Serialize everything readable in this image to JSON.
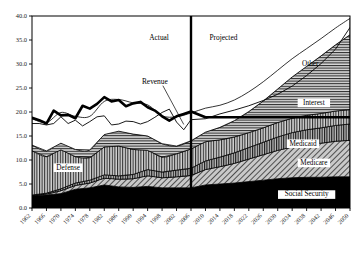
{
  "chart_data": {
    "type": "area",
    "title": "",
    "subtitle": "",
    "xlabel": "",
    "ylabel": "",
    "xlim": [
      1962,
      2050
    ],
    "ylim": [
      0,
      40
    ],
    "ytick_step": 5,
    "xtick_step": 4,
    "grid": false,
    "legend_position": "inline-annotations",
    "stacked": true,
    "ytick_labels": [
      "0.0",
      "5.0",
      "10.0",
      "15.0",
      "20.0",
      "25.0",
      "30.0",
      "35.0",
      "40.0"
    ],
    "ytick_values": [
      0,
      5,
      10,
      15,
      20,
      25,
      30,
      35,
      40
    ],
    "xtick_labels": [
      "1962",
      "1966",
      "1970",
      "1974",
      "1978",
      "1982",
      "1986",
      "1990",
      "1994",
      "1998",
      "2002",
      "2006",
      "2010",
      "2014",
      "2018",
      "2022",
      "2026",
      "2030",
      "2034",
      "2038",
      "2042",
      "2046",
      "2050"
    ],
    "xtick_values": [
      1962,
      1966,
      1970,
      1974,
      1978,
      1982,
      1986,
      1990,
      1994,
      1998,
      2002,
      2006,
      2010,
      2014,
      2018,
      2022,
      2026,
      2030,
      2034,
      2038,
      2042,
      2046,
      2050
    ],
    "annotations": [
      {
        "name": "actual-label",
        "text": "Actual",
        "x": 2001,
        "y": 35.0
      },
      {
        "name": "projected-label",
        "text": "Projected",
        "x": 2010,
        "y": 35.0
      },
      {
        "name": "divider-year",
        "text": "2006",
        "x": 2006,
        "y": 40
      }
    ],
    "x": [
      1962,
      1966,
      1970,
      1974,
      1978,
      1982,
      1986,
      1990,
      1994,
      1998,
      2002,
      2006,
      2010,
      2014,
      2018,
      2022,
      2026,
      2030,
      2034,
      2038,
      2042,
      2046,
      2050
    ],
    "series": [
      {
        "name": "Social Security",
        "label": "Social Security",
        "fill": "solid-black",
        "color": "#000000",
        "label_x": 2038,
        "label_y": 2.4,
        "values": [
          2.6,
          2.7,
          3.0,
          3.9,
          4.2,
          4.8,
          4.4,
          4.3,
          4.5,
          4.2,
          4.2,
          4.2,
          4.8,
          5.0,
          5.2,
          5.5,
          5.8,
          6.1,
          6.3,
          6.4,
          6.4,
          6.5,
          6.5
        ]
      },
      {
        "name": "Medicare",
        "label": "Medicare",
        "fill": "diagonal-hatch",
        "color": "#9a9a9a",
        "label_x": 2040,
        "label_y": 9.0,
        "values": [
          0.0,
          0.2,
          0.6,
          0.8,
          1.0,
          1.4,
          1.6,
          1.8,
          2.2,
          2.1,
          2.3,
          2.6,
          3.2,
          3.6,
          4.1,
          4.7,
          5.3,
          5.9,
          6.4,
          6.8,
          7.1,
          7.4,
          7.6
        ]
      },
      {
        "name": "Medicaid",
        "label": "Medicaid",
        "fill": "vertical-lines",
        "color": "#8c8c8c",
        "label_x": 2037,
        "label_y": 13.0,
        "values": [
          0.1,
          0.2,
          0.4,
          0.5,
          0.6,
          0.7,
          0.7,
          0.9,
          1.3,
          1.2,
          1.4,
          1.5,
          1.8,
          2.0,
          2.2,
          2.4,
          2.6,
          2.8,
          3.0,
          3.1,
          3.2,
          3.3,
          3.4
        ]
      },
      {
        "name": "Defense",
        "label": "Defense",
        "fill": "vertical-lines",
        "color": "#a6a6a6",
        "label_x": 1972,
        "label_y": 8.0,
        "values": [
          9.2,
          7.6,
          8.1,
          5.5,
          4.7,
          5.8,
          6.2,
          5.2,
          4.0,
          3.1,
          3.4,
          4.0,
          4.0,
          3.6,
          3.3,
          3.1,
          3.0,
          3.0,
          3.0,
          3.0,
          3.0,
          3.0,
          3.0
        ]
      },
      {
        "name": "Interest",
        "label": "Interest",
        "fill": "horizontal-lines",
        "color": "#7a7a7a",
        "label_x": 2040,
        "label_y": 21.5,
        "values": [
          1.2,
          1.2,
          1.4,
          1.5,
          1.6,
          2.6,
          3.1,
          3.2,
          3.0,
          2.8,
          1.6,
          1.7,
          2.0,
          2.6,
          3.4,
          4.4,
          5.6,
          7.0,
          8.6,
          10.2,
          12.0,
          13.8,
          15.6
        ]
      },
      {
        "name": "Other",
        "label": "Other",
        "fill": "white",
        "color": "#ffffff",
        "label_x": 2039,
        "label_y": 29.5,
        "values": [
          5.5,
          5.9,
          6.4,
          6.9,
          7.0,
          6.9,
          6.6,
          6.5,
          6.5,
          5.8,
          6.1,
          5.8,
          5.0,
          4.6,
          4.3,
          4.1,
          4.0,
          3.9,
          3.8,
          3.7,
          3.6,
          3.5,
          3.4
        ]
      }
    ],
    "lines": [
      {
        "name": "Total Outlays",
        "label": "",
        "style": "thick-solid",
        "width": 2.6,
        "color": "#000000",
        "x": [
          1962,
          1964,
          1966,
          1968,
          1970,
          1972,
          1974,
          1976,
          1978,
          1980,
          1982,
          1984,
          1986,
          1988,
          1990,
          1992,
          1994,
          1996,
          1998,
          2000,
          2002,
          2004,
          2006,
          2010,
          2014,
          2018,
          2022,
          2026,
          2030,
          2034,
          2038,
          2042,
          2046,
          2050
        ],
        "values": [
          18.8,
          18.3,
          17.6,
          20.3,
          19.3,
          19.4,
          18.7,
          21.3,
          20.7,
          21.7,
          23.1,
          22.2,
          22.5,
          21.2,
          21.8,
          22.1,
          21.0,
          20.3,
          19.1,
          18.2,
          19.1,
          19.6,
          20.1,
          18.9,
          18.9,
          18.9,
          18.9,
          18.9,
          18.9,
          18.9,
          18.9,
          18.9,
          18.9,
          18.9
        ]
      },
      {
        "name": "Revenue",
        "label": "Revenue",
        "style": "thin-solid",
        "width": 0.9,
        "color": "#000000",
        "label_x": 1996,
        "label_y": 25.9,
        "x": [
          1962,
          1964,
          1966,
          1968,
          1970,
          1972,
          1974,
          1976,
          1978,
          1980,
          1982,
          1984,
          1986,
          1988,
          1990,
          1992,
          1994,
          1996,
          1998,
          2000,
          2002,
          2004,
          2006,
          2010,
          2014,
          2018,
          2022,
          2026,
          2030,
          2034,
          2038,
          2042,
          2046,
          2050
        ],
        "values": [
          17.6,
          17.6,
          17.3,
          17.6,
          19.0,
          17.6,
          18.3,
          17.1,
          18.0,
          19.0,
          19.2,
          17.3,
          17.5,
          18.1,
          18.0,
          17.5,
          18.0,
          18.9,
          19.9,
          20.6,
          17.9,
          16.3,
          18.4,
          18.6,
          19.6,
          20.4,
          21.3,
          22.4,
          23.7,
          25.4,
          27.6,
          30.1,
          33.1,
          37.6
        ]
      }
    ],
    "divider": {
      "name": "actual-projected-divider",
      "x": 2006,
      "style": "thick-vertical",
      "width": 2.4,
      "color": "#000000"
    }
  }
}
